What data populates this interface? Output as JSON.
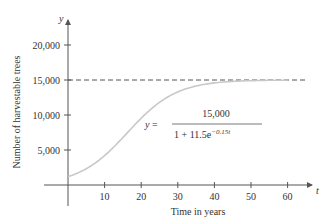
{
  "chart_data": {
    "type": "line",
    "title": "",
    "xlabel": "Time in years",
    "ylabel": "Number of harvestable trees",
    "x_axis_var": "t",
    "y_axis_var": "y",
    "xlim": [
      -5,
      66
    ],
    "ylim": [
      -1500,
      22500
    ],
    "x_ticks": [
      10,
      20,
      30,
      40,
      50,
      60
    ],
    "x_tick_labels": [
      "10",
      "20",
      "30",
      "40",
      "50",
      "60"
    ],
    "y_ticks": [
      5000,
      10000,
      15000,
      20000
    ],
    "y_tick_labels": [
      "5,000",
      "10,000",
      "15,000",
      "20,000"
    ],
    "grid": false,
    "series": [
      {
        "name": "y = 15,000 / (1 + 11.5e^{-0.15t})",
        "style": "solid",
        "color": "#c8c8c8",
        "x": [
          0,
          5,
          10,
          15,
          20,
          25,
          30,
          35,
          40,
          45,
          50,
          55,
          60
        ],
        "values": [
          1200,
          2326,
          4204,
          6771,
          9420,
          11595,
          13013,
          13873,
          14374,
          14657,
          14815,
          14903,
          14951
        ]
      },
      {
        "name": "asymptote y = 15,000",
        "style": "dashed",
        "color": "#555555",
        "x": [
          0,
          65
        ],
        "values": [
          15000,
          15000
        ]
      }
    ],
    "annotations": [
      {
        "text_lhs": "y =",
        "numerator": "15,000",
        "denominator_base": "1 + 11.5e",
        "denominator_exp": "−0.15t"
      }
    ]
  }
}
